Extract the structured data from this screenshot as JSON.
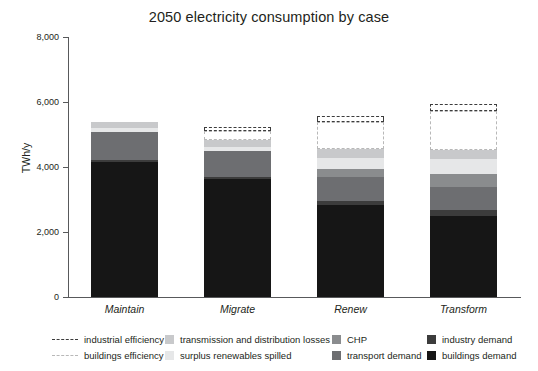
{
  "chart_data": {
    "type": "bar",
    "stacked": true,
    "title": "2050 electricity consumption by case",
    "xlabel": "",
    "ylabel": "TWh/y",
    "ylim": [
      0,
      8000
    ],
    "yticks": [
      0,
      2000,
      4000,
      6000,
      8000
    ],
    "ytick_labels": [
      "0",
      "2,000",
      "4,000",
      "6,000",
      "8,000"
    ],
    "grid": false,
    "legend_position": "bottom",
    "categories": [
      "Maintain",
      "Migrate",
      "Renew",
      "Transform"
    ],
    "series": [
      {
        "name": "buildings demand",
        "color": "#161616",
        "style": "filled",
        "values": [
          4150,
          3620,
          2840,
          2500
        ]
      },
      {
        "name": "industry demand",
        "color": "#3c3c3c",
        "style": "filled",
        "values": [
          60,
          70,
          120,
          180
        ]
      },
      {
        "name": "transport demand",
        "color": "#6d6e71",
        "style": "filled",
        "values": [
          870,
          800,
          740,
          700
        ]
      },
      {
        "name": "CHP",
        "color": "#8a8c8e",
        "style": "filled",
        "values": [
          0,
          0,
          230,
          390
        ]
      },
      {
        "name": "surplus renewables spilled",
        "color": "#e6e7e8",
        "style": "filled",
        "values": [
          110,
          120,
          350,
          490
        ]
      },
      {
        "name": "transmission and distribution losses",
        "color": "#c8c9cb",
        "style": "filled",
        "values": [
          210,
          220,
          260,
          260
        ]
      },
      {
        "name": "buildings efficiency",
        "color": "#b8b8b8",
        "style": "dashed-outline",
        "values": [
          0,
          290,
          830,
          1200
        ]
      },
      {
        "name": "industrial efficiency",
        "color": "#3c3c3c",
        "style": "dashed-outline",
        "values": [
          0,
          120,
          190,
          220
        ]
      }
    ],
    "totals_solid": [
      5400,
      4830,
      4540,
      4520
    ],
    "totals_with_ghost": [
      5400,
      5240,
      5560,
      5940
    ],
    "annotations": []
  },
  "legend": {
    "columns": [
      {
        "entries": [
          {
            "label": "industrial efficiency",
            "marker": "dashed-line",
            "color": "#3c3c3c"
          },
          {
            "label": "buildings efficiency",
            "marker": "dashed-line-light",
            "color": "#b8b8b8"
          }
        ]
      },
      {
        "entries": [
          {
            "label": "transmission and distribution losses",
            "marker": "swatch",
            "color": "#c8c9cb"
          },
          {
            "label": "surplus renewables spilled",
            "marker": "swatch",
            "color": "#e6e7e8"
          }
        ]
      },
      {
        "entries": [
          {
            "label": "CHP",
            "marker": "swatch",
            "color": "#8a8c8e"
          },
          {
            "label": "transport demand",
            "marker": "swatch",
            "color": "#6d6e71"
          }
        ]
      },
      {
        "entries": [
          {
            "label": "industry demand",
            "marker": "swatch",
            "color": "#3c3c3c"
          },
          {
            "label": "buildings demand",
            "marker": "swatch",
            "color": "#161616"
          }
        ]
      }
    ]
  },
  "colors": {
    "axis": "#58595b",
    "text": "#231f20",
    "background": "#ffffff"
  }
}
